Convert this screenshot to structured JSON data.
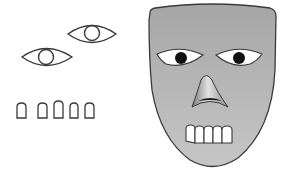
{
  "figure": {
    "colors": {
      "background": "#ffffff",
      "mask_fill_top": "#a9a9a9",
      "mask_fill_bottom": "#c4c4c4",
      "outline": "#3a3a3a",
      "eye_white": "#ffffff",
      "pupil": "#111111",
      "nose_light": "#dcdcdc",
      "nose_dark": "#6a6a6a",
      "tooth_fill": "#ffffff"
    },
    "loose_parts": {
      "eyes": [
        {
          "name": "loose-eye-left",
          "cx": 46,
          "cy": 57
        },
        {
          "name": "loose-eye-right",
          "cx": 92,
          "cy": 33
        }
      ],
      "teeth": [
        {
          "x": 17,
          "y": 103,
          "w": 9,
          "h": 15
        },
        {
          "x": 38,
          "y": 103,
          "w": 9,
          "h": 15
        },
        {
          "x": 54,
          "y": 101,
          "w": 9,
          "h": 17
        },
        {
          "x": 70,
          "y": 103,
          "w": 8,
          "h": 15
        },
        {
          "x": 85,
          "y": 103,
          "w": 9,
          "h": 15
        }
      ]
    },
    "mask": {
      "eyes": [
        {
          "name": "mask-eye-left",
          "cx": 181,
          "cy": 58
        },
        {
          "name": "mask-eye-right",
          "cx": 238,
          "cy": 58
        }
      ],
      "teeth_count": 5
    }
  }
}
